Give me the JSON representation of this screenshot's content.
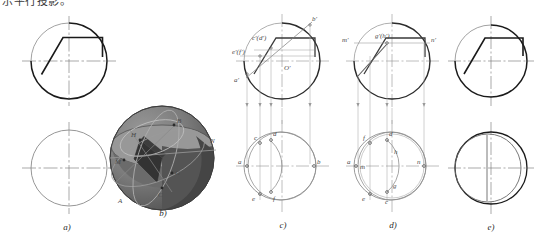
{
  "document": {
    "top_note": "示平行投影。",
    "figure_type": "descriptive-geometry-sphere-cut"
  },
  "colors": {
    "outline": "#1a1a1a",
    "thin": "#8a8a8a",
    "centerline": "#6e6e6e",
    "projection": "#9a9a9a",
    "sphere_light": "#8f8f8f",
    "sphere_mid": "#707070",
    "sphere_dark": "#4f4f4f",
    "sphere_darkest": "#3b3b3b",
    "label": "#4a4a4a"
  },
  "panels": [
    {
      "id": "a",
      "caption": "a)",
      "title": "given-views",
      "views": [
        "front-view-circle-with-cut",
        "top-view-circle"
      ],
      "labels": []
    },
    {
      "id": "b",
      "caption": "b)",
      "title": "pictorial-sphere",
      "views": [
        "shaded-sphere-with-section-curves"
      ],
      "labels": [
        "A",
        "B",
        "C",
        "G",
        "H",
        "M",
        "N"
      ]
    },
    {
      "id": "c",
      "caption": "c)",
      "title": "construction-step-1",
      "views": [
        "front-view-with-points",
        "top-view-with-points"
      ],
      "labels": {
        "front": [
          "b'",
          "c'(d')",
          "e'(f')",
          "a'",
          "O'"
        ],
        "top": [
          "a",
          "c",
          "d",
          "b",
          "e",
          "f"
        ]
      }
    },
    {
      "id": "d",
      "caption": "d)",
      "title": "construction-step-2",
      "views": [
        "front-view-with-points",
        "top-view-with-points"
      ],
      "labels": {
        "front": [
          "m'",
          "g'(h')",
          "n'"
        ],
        "top": [
          "a",
          "m",
          "f",
          "d",
          "h",
          "n",
          "e",
          "c",
          "g"
        ]
      }
    },
    {
      "id": "e",
      "caption": "e)",
      "title": "result-views",
      "views": [
        "front-view-circle-with-cut",
        "top-view-result"
      ],
      "labels": []
    }
  ],
  "label_text": {
    "b_prime": "b'",
    "cd_prime": "c'(d')",
    "ef_prime": "e'(f')",
    "a_prime": "a'",
    "o_prime": "O'",
    "m_prime": "m'",
    "gh_prime": "g'(h')",
    "n_prime": "n'",
    "a": "a",
    "b": "b",
    "c": "c",
    "d": "d",
    "e": "e",
    "f": "f",
    "g": "g",
    "h": "h",
    "m": "m",
    "n": "n",
    "A": "A",
    "B": "B",
    "C": "C",
    "G": "G",
    "H": "H",
    "M": "M",
    "N": "N"
  },
  "captions": {
    "a": "a)",
    "b": "b)",
    "c": "c)",
    "d": "d)",
    "e": "e)"
  }
}
